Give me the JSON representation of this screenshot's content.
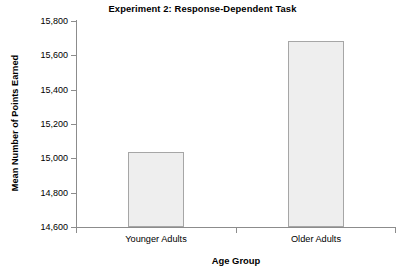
{
  "chart_data": {
    "type": "bar",
    "title": "Experiment 2: Response-Dependent Task",
    "xlabel": "Age Group",
    "ylabel": "Mean Number of Points Earned",
    "categories": [
      "Younger Adults",
      "Older Adults"
    ],
    "values": [
      15035,
      15685
    ],
    "ylim": [
      14600,
      15800
    ],
    "yticks": [
      14600,
      14800,
      15000,
      15200,
      15400,
      15600,
      15800
    ],
    "ytick_labels": [
      "14,600",
      "14,800",
      "15,000",
      "15,200",
      "15,400",
      "15,600",
      "15,800"
    ],
    "grid": false,
    "legend": null,
    "series": [
      {
        "name": "Mean Number of Points Earned",
        "values": [
          15035,
          15685
        ]
      }
    ],
    "colors": {
      "bar_fill": "#eeeeee",
      "bar_border": "#a6a6a6",
      "axis": "#8c8c8c",
      "text": "#000000",
      "background": "#ffffff"
    }
  }
}
